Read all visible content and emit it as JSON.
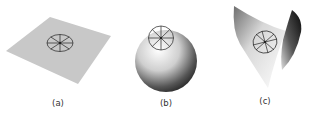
{
  "figure": {
    "panels": [
      {
        "id": "a",
        "label": "(a)",
        "surface": "flat plane",
        "curvature": "zero"
      },
      {
        "id": "b",
        "label": "(b)",
        "surface": "sphere",
        "curvature": "positive"
      },
      {
        "id": "c",
        "label": "(c)",
        "surface": "saddle",
        "curvature": "negative"
      }
    ],
    "marker": "circle with 8 radial spokes drawn on each surface",
    "colors": {
      "plane": "#c8c8c8",
      "sphere_light": "#ffffff",
      "sphere_dark": "#2a2a2a",
      "saddle_dark": "#111111",
      "stroke": "#222222",
      "caption": "#333333"
    }
  }
}
